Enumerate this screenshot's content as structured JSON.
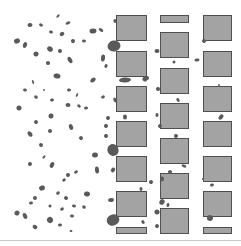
{
  "figure": {
    "width": 241,
    "height": 246,
    "colors": {
      "background": "#ffffff",
      "obstacle_fill": "#a3a3a3",
      "obstacle_stroke": "#4f4f4f",
      "particle": "#5a5a5a",
      "baseline": "#c8c8c8"
    },
    "obstacles": [
      {
        "x": 116,
        "y": 15,
        "w": 30,
        "h": 25
      },
      {
        "x": 116,
        "y": 51,
        "w": 30,
        "h": 25
      },
      {
        "x": 116,
        "y": 86,
        "w": 30,
        "h": 25
      },
      {
        "x": 116,
        "y": 121,
        "w": 30,
        "h": 25
      },
      {
        "x": 116,
        "y": 156,
        "w": 30,
        "h": 25
      },
      {
        "x": 116,
        "y": 191,
        "w": 30,
        "h": 25
      },
      {
        "x": 116,
        "y": 227,
        "w": 30,
        "h": 6
      },
      {
        "x": 160,
        "y": 15,
        "w": 28,
        "h": 7
      },
      {
        "x": 160,
        "y": 32,
        "w": 28,
        "h": 25
      },
      {
        "x": 160,
        "y": 68,
        "w": 28,
        "h": 25
      },
      {
        "x": 160,
        "y": 103,
        "w": 28,
        "h": 25
      },
      {
        "x": 160,
        "y": 138,
        "w": 28,
        "h": 25
      },
      {
        "x": 160,
        "y": 173,
        "w": 28,
        "h": 25
      },
      {
        "x": 160,
        "y": 208,
        "w": 28,
        "h": 25
      },
      {
        "x": 203,
        "y": 15,
        "w": 28,
        "h": 25
      },
      {
        "x": 203,
        "y": 51,
        "w": 28,
        "h": 25
      },
      {
        "x": 203,
        "y": 86,
        "w": 28,
        "h": 25
      },
      {
        "x": 203,
        "y": 121,
        "w": 28,
        "h": 25
      },
      {
        "x": 203,
        "y": 156,
        "w": 28,
        "h": 25
      },
      {
        "x": 203,
        "y": 191,
        "w": 28,
        "h": 25
      },
      {
        "x": 203,
        "y": 227,
        "w": 28,
        "h": 6
      }
    ],
    "particles": [
      [
        58,
        16,
        4,
        2
      ],
      [
        30,
        25,
        5,
        4
      ],
      [
        41,
        25,
        4,
        3
      ],
      [
        68,
        23,
        5,
        3
      ],
      [
        51,
        32,
        4,
        3
      ],
      [
        62,
        34,
        5,
        4
      ],
      [
        93,
        31,
        7,
        5
      ],
      [
        101,
        30,
        5,
        3
      ],
      [
        17,
        41,
        6,
        5
      ],
      [
        25,
        45,
        4,
        6
      ],
      [
        73,
        41,
        4,
        4
      ],
      [
        84,
        41,
        4,
        3
      ],
      [
        50,
        49,
        6,
        5
      ],
      [
        60,
        51,
        4,
        4
      ],
      [
        36,
        54,
        5,
        5
      ],
      [
        70,
        60,
        4,
        7
      ],
      [
        103,
        58,
        4,
        7
      ],
      [
        48,
        63,
        4,
        4
      ],
      [
        114,
        46,
        13,
        11
      ],
      [
        106,
        66,
        3,
        4
      ],
      [
        115,
        21,
        3,
        4
      ],
      [
        57,
        76,
        7,
        5
      ],
      [
        93,
        80,
        6,
        4
      ],
      [
        125,
        80,
        12,
        5
      ],
      [
        145,
        79,
        5,
        5
      ],
      [
        33,
        82,
        2,
        4
      ],
      [
        25,
        90,
        4,
        3
      ],
      [
        44,
        90,
        2,
        2
      ],
      [
        69,
        90,
        4,
        3
      ],
      [
        36,
        97,
        4,
        3
      ],
      [
        52,
        100,
        4,
        3
      ],
      [
        77,
        95,
        2,
        4
      ],
      [
        103,
        97,
        4,
        3
      ],
      [
        68,
        105,
        5,
        4
      ],
      [
        79,
        106,
        4,
        3
      ],
      [
        86,
        108,
        4,
        3
      ],
      [
        19,
        108,
        5,
        5
      ],
      [
        115,
        100,
        3,
        5
      ],
      [
        51,
        116,
        5,
        5
      ],
      [
        36,
        122,
        4,
        4
      ],
      [
        125,
        117,
        4,
        5
      ],
      [
        108,
        118,
        4,
        4
      ],
      [
        71,
        127,
        4,
        6
      ],
      [
        106,
        126,
        4,
        4
      ],
      [
        30,
        134,
        4,
        6
      ],
      [
        50,
        131,
        4,
        4
      ],
      [
        81,
        138,
        4,
        4
      ],
      [
        106,
        136,
        4,
        4
      ],
      [
        41,
        145,
        4,
        4
      ],
      [
        113,
        150,
        11,
        12
      ],
      [
        95,
        155,
        6,
        5
      ],
      [
        44,
        157,
        2,
        4
      ],
      [
        30,
        164,
        4,
        4
      ],
      [
        52,
        165,
        4,
        6
      ],
      [
        76,
        172,
        4,
        3
      ],
      [
        68,
        175,
        4,
        4
      ],
      [
        64,
        180,
        4,
        3
      ],
      [
        97,
        170,
        4,
        7
      ],
      [
        113,
        170,
        4,
        5
      ],
      [
        42,
        188,
        6,
        5
      ],
      [
        87,
        194,
        6,
        5
      ],
      [
        58,
        193,
        4,
        3
      ],
      [
        35,
        198,
        4,
        4
      ],
      [
        66,
        198,
        4,
        4
      ],
      [
        31,
        203,
        4,
        3
      ],
      [
        50,
        206,
        3,
        3
      ],
      [
        62,
        209,
        4,
        3
      ],
      [
        74,
        206,
        4,
        3
      ],
      [
        84,
        207,
        4,
        3
      ],
      [
        111,
        200,
        6,
        4
      ],
      [
        17,
        213,
        5,
        5
      ],
      [
        25,
        216,
        4,
        6
      ],
      [
        72,
        216,
        4,
        3
      ],
      [
        50,
        220,
        6,
        6
      ],
      [
        60,
        225,
        4,
        3
      ],
      [
        35,
        227,
        5,
        4
      ],
      [
        113,
        220,
        13,
        11
      ],
      [
        71,
        231,
        3,
        2
      ],
      [
        143,
        222,
        3,
        4
      ],
      [
        157,
        51,
        5,
        4
      ],
      [
        174,
        62,
        3,
        3
      ],
      [
        147,
        78,
        4,
        4
      ],
      [
        158,
        89,
        4,
        4
      ],
      [
        178,
        100,
        3,
        4
      ],
      [
        157,
        115,
        3,
        4
      ],
      [
        160,
        126,
        4,
        4
      ],
      [
        176,
        136,
        4,
        4
      ],
      [
        184,
        166,
        5,
        3
      ],
      [
        170,
        172,
        4,
        4
      ],
      [
        162,
        179,
        4,
        5
      ],
      [
        151,
        182,
        4,
        4
      ],
      [
        141,
        189,
        3,
        4
      ],
      [
        162,
        202,
        5,
        6
      ],
      [
        157,
        212,
        5,
        5
      ],
      [
        168,
        205,
        3,
        4
      ],
      [
        204,
        41,
        4,
        4
      ],
      [
        197,
        60,
        5,
        3
      ],
      [
        221,
        117,
        4,
        6
      ],
      [
        212,
        185,
        4,
        3
      ],
      [
        210,
        218,
        6,
        6
      ],
      [
        219,
        85,
        2,
        2
      ],
      [
        203,
        179,
        2,
        2
      ],
      [
        157,
        226,
        4,
        4
      ]
    ]
  }
}
